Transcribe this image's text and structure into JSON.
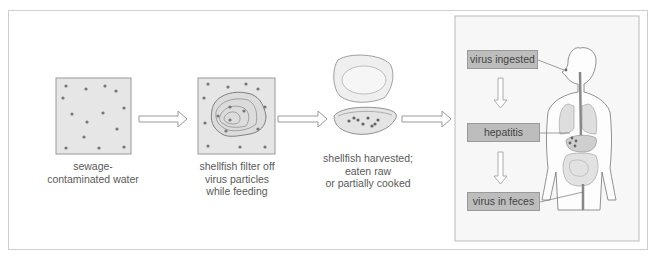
{
  "steps": [
    {
      "caption_1": "sewage-",
      "caption_2": "contaminated water"
    },
    {
      "caption_1": "shellfish filter off",
      "caption_2": "virus particles",
      "caption_3": "while feeding"
    },
    {
      "caption_1": "shellfish harvested;",
      "caption_2": "eaten raw",
      "caption_3": "or partially cooked"
    }
  ],
  "body_panel": {
    "labels": [
      "virus ingested",
      "hepatitis",
      "virus in feces"
    ]
  },
  "colors": {
    "label_fill": "#bdbdbd",
    "dot": "#777777",
    "panel_bg": "#f7f7f7",
    "organ_fill": "#dddddd"
  }
}
